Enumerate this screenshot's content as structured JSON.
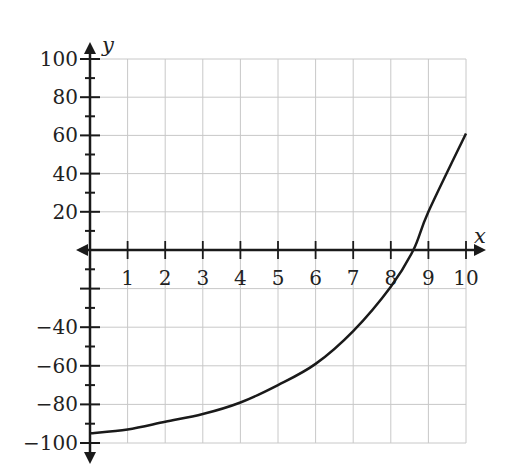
{
  "chart_data": {
    "type": "line",
    "title": "",
    "xlabel": "x",
    "ylabel": "y",
    "xlim": [
      0,
      10
    ],
    "ylim": [
      -100,
      100
    ],
    "grid": true,
    "x_ticks": [
      1,
      2,
      3,
      4,
      5,
      6,
      7,
      8,
      9,
      10
    ],
    "x_tick_labels": [
      "1",
      "2",
      "3",
      "4",
      "5",
      "6",
      "7",
      "8",
      "9",
      "10"
    ],
    "y_ticks_labeled": [
      100,
      80,
      60,
      40,
      20,
      -40,
      -60,
      -80,
      -100
    ],
    "y_tick_labels": [
      "100",
      "80",
      "60",
      "40",
      "20",
      "−40",
      "−60",
      "−80",
      "−100"
    ],
    "series": [
      {
        "name": "curve",
        "x": [
          0,
          1,
          2,
          3,
          4,
          5,
          6,
          7,
          8,
          8.6,
          9,
          10
        ],
        "y": [
          -95,
          -93,
          -89,
          -85,
          -79,
          -70,
          -59,
          -42,
          -19,
          0,
          20,
          61
        ]
      }
    ],
    "colors": {
      "curve": "#1a1a1a",
      "grid": "#c8c8c8",
      "axis": "#1a1a1a"
    }
  }
}
